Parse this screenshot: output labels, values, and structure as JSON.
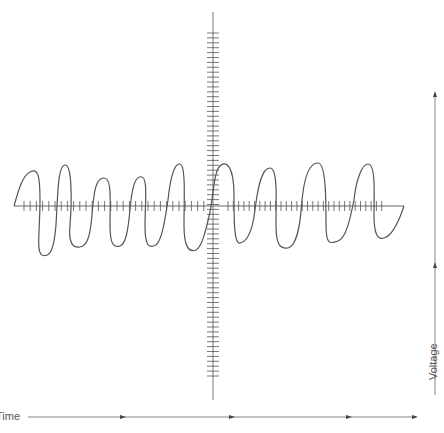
{
  "diagram": {
    "title": "",
    "time_label": "Time",
    "voltage_label": "Voltage",
    "colors": {
      "line": "#555555",
      "axis": "#666666",
      "ticks": "#555555",
      "background": "#ffffff"
    },
    "time_arrow": {
      "y": 417,
      "x_start": 28,
      "x_end": 416,
      "arrowheads_at_x": [
        124,
        232,
        350,
        416
      ]
    },
    "voltage_arrow": {
      "x": 435,
      "y_start": 395,
      "y_end": 93,
      "arrowheads_at_y": [
        93,
        265
      ]
    }
  },
  "chart_data": {
    "type": "line",
    "title": "",
    "xlabel": "Time",
    "ylabel": "Voltage",
    "axes": {
      "horizontal": {
        "y": 206,
        "x_start": 14,
        "x_end": 404,
        "tick_count_left": 30,
        "tick_count_right": 30
      },
      "vertical": {
        "x": 213,
        "y_start": 12,
        "y_end": 400,
        "tick_y_start": 33,
        "tick_y_end": 378
      }
    },
    "waveform": {
      "description": "Irregular square-ish oscillating wave with 9 positive lobes crossing the horizontal axis",
      "positive_peaks_y": [
        172,
        165,
        180,
        176,
        163,
        168,
        170,
        163,
        164
      ],
      "negative_troughs_y": [
        254,
        248,
        247,
        247,
        252,
        244,
        248,
        241,
        238
      ]
    }
  }
}
